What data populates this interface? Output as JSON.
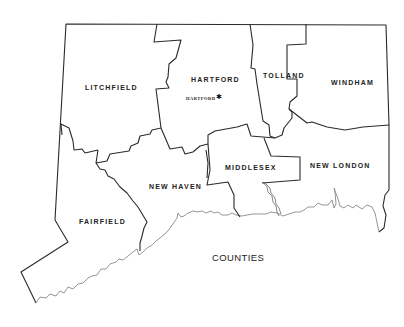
{
  "map": {
    "title": "COUNTIES",
    "state": "Connecticut",
    "counties": [
      {
        "name": "LITCHFIELD",
        "x": 85,
        "y": 84
      },
      {
        "name": "HARTFORD",
        "x": 191,
        "y": 76
      },
      {
        "name": "TOLLAND",
        "x": 263,
        "y": 72
      },
      {
        "name": "WINDHAM",
        "x": 331,
        "y": 79
      },
      {
        "name": "MIDDLESEX",
        "x": 225,
        "y": 164
      },
      {
        "name": "NEW LONDON",
        "x": 310,
        "y": 162
      },
      {
        "name": "NEW HAVEN",
        "x": 149,
        "y": 183
      },
      {
        "name": "FAIRFIELD",
        "x": 79,
        "y": 218
      }
    ],
    "capital": {
      "name": "HARTFORD",
      "symbol": "✱",
      "x": 186,
      "y": 96
    },
    "colors": {
      "border": "#2a2a2a",
      "coast": "#8a8a8a",
      "background": "#ffffff"
    }
  }
}
